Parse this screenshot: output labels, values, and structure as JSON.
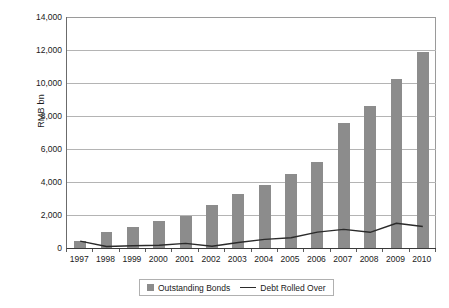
{
  "chart_data": {
    "type": "bar",
    "title": "",
    "xlabel": "",
    "ylabel": "RMB bn",
    "ylim": [
      0,
      14000
    ],
    "ytick_values": [
      0,
      2000,
      4000,
      6000,
      8000,
      10000,
      12000,
      14000
    ],
    "ytick_labels": [
      "0",
      "2,000",
      "4,000",
      "6,000",
      "8,000",
      "10,000",
      "12,000",
      "14,000"
    ],
    "grid": true,
    "legend_position": "bottom",
    "categories": [
      "1997",
      "1998",
      "1999",
      "2000",
      "2001",
      "2002",
      "2003",
      "2004",
      "2005",
      "2006",
      "2007",
      "2008",
      "2009",
      "2010"
    ],
    "series": [
      {
        "name": "Outstanding Bonds",
        "type": "bar",
        "color": "#8c8c8c",
        "values": [
          450,
          1000,
          1280,
          1650,
          1950,
          2620,
          3280,
          3800,
          4500,
          5230,
          7550,
          8580,
          10220,
          11880
        ]
      },
      {
        "name": "Debt Rolled Over",
        "type": "line",
        "color": "#2b2b2b",
        "values": [
          420,
          90,
          140,
          170,
          280,
          110,
          330,
          520,
          620,
          960,
          1130,
          950,
          1500,
          1300
        ]
      }
    ]
  },
  "legend": {
    "entries": [
      {
        "label": "Outstanding Bonds",
        "marker": "square-swatch-icon"
      },
      {
        "label": "Debt Rolled Over",
        "marker": "line-swatch-icon"
      }
    ]
  }
}
